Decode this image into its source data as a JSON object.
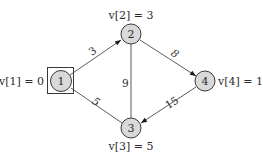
{
  "diagram": {
    "type": "weighted-graph",
    "start_node": "1",
    "nodes": [
      {
        "id": "1",
        "label": "1",
        "value_label": "v[1] = 0",
        "x": 61,
        "y": 81,
        "r": 11
      },
      {
        "id": "2",
        "label": "2",
        "value_label": "v[2] = 3",
        "x": 131,
        "y": 34,
        "r": 10
      },
      {
        "id": "3",
        "label": "3",
        "value_label": "v[3] = 5",
        "x": 131,
        "y": 128,
        "r": 10
      },
      {
        "id": "4",
        "label": "4",
        "value_label": "v[4] = 11",
        "x": 205,
        "y": 81,
        "r": 10
      }
    ],
    "edges": [
      {
        "from": "1",
        "to": "2",
        "weight": "3",
        "directed": true
      },
      {
        "from": "2",
        "to": "4",
        "weight": "8",
        "directed": true
      },
      {
        "from": "1",
        "to": "3",
        "weight": "5",
        "directed": false
      },
      {
        "from": "2",
        "to": "3",
        "weight": "9",
        "directed": false
      },
      {
        "from": "4",
        "to": "3",
        "weight": "15",
        "directed": true
      }
    ]
  },
  "colors": {
    "node_fill": "#d9d9d9",
    "stroke": "#3a3a3a",
    "text": "#2a2a2a",
    "background": "#ffffff"
  }
}
